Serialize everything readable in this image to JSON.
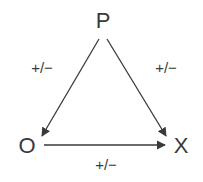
{
  "diagram": {
    "nodes": [
      {
        "id": "P",
        "label": "P"
      },
      {
        "id": "O",
        "label": "O"
      },
      {
        "id": "X",
        "label": "X"
      }
    ],
    "edges": [
      {
        "from": "P",
        "to": "O",
        "label": "+/−"
      },
      {
        "from": "P",
        "to": "X",
        "label": "+/−"
      },
      {
        "from": "O",
        "to": "X",
        "label": "+/−"
      }
    ],
    "colors": {
      "line": "#3a3a3a",
      "background": "#ffffff"
    }
  }
}
